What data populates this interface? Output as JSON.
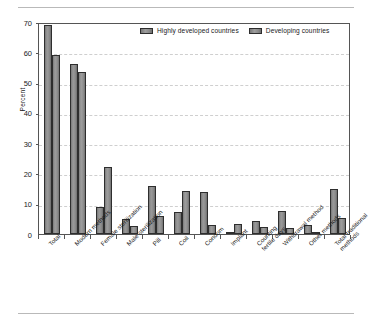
{
  "chart_data": {
    "type": "bar",
    "title": "",
    "subtitle": "",
    "xlabel": "",
    "ylabel": "Percent",
    "ylim": [
      0,
      70
    ],
    "yticks": [
      0,
      10,
      20,
      30,
      40,
      50,
      60,
      70
    ],
    "grid": true,
    "legend_position": "top-center",
    "categories": [
      "Total",
      "Modern methods",
      "Female sterilization",
      "Male sterilization",
      "Pill",
      "Coil",
      "Condom",
      "Implant",
      "Counting\nfertile days",
      "Withdrawal method",
      "Other methods",
      "Total traditional\nmethods"
    ],
    "series": [
      {
        "name": "Highly developed countries",
        "values": [
          69,
          56,
          9,
          5,
          15.7,
          7.3,
          14,
          0.5,
          4.2,
          7.5,
          3,
          15
        ]
      },
      {
        "name": "Developing countries",
        "values": [
          59.2,
          53.4,
          22.1,
          2.7,
          5.8,
          14.3,
          3,
          3.2,
          2.2,
          2,
          0.8,
          5.4
        ]
      }
    ]
  },
  "legend": {
    "items": [
      {
        "label": "Highly developed countries",
        "color": "#8a8a8a"
      },
      {
        "label": "Developing countries",
        "color": "#8a8a8a"
      }
    ]
  },
  "axis": {
    "y_title": "Percent",
    "y_tick_labels": [
      "70",
      "60",
      "50",
      "40",
      "30",
      "20",
      "10",
      "0"
    ]
  }
}
